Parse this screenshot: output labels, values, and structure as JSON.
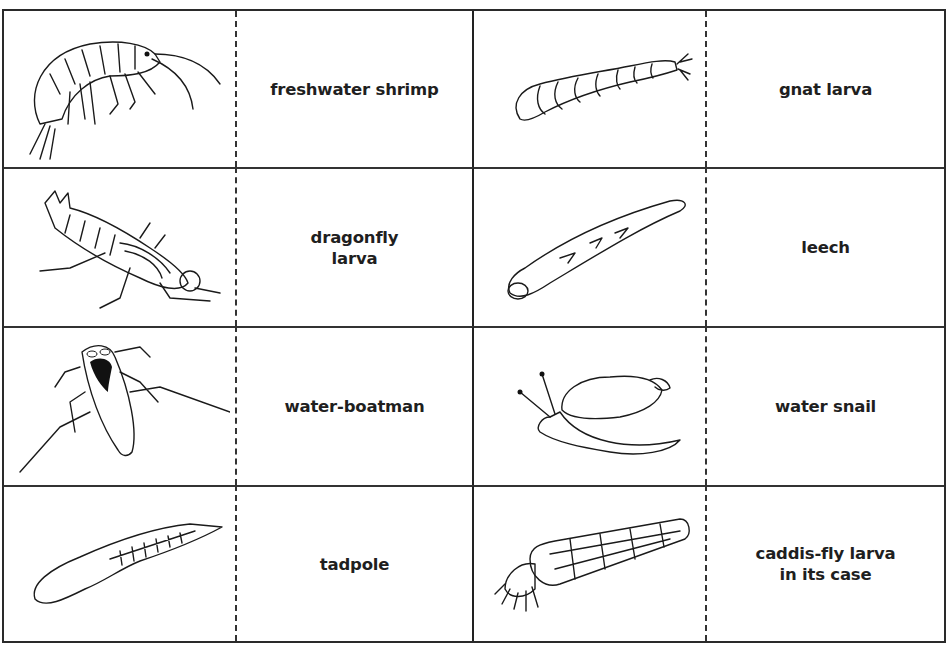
{
  "cards": [
    {
      "row": 0,
      "col": 0,
      "picture": "freshwater-shrimp-drawing",
      "label": "freshwater shrimp"
    },
    {
      "row": 0,
      "col": 1,
      "picture": "gnat-larva-drawing",
      "label": "gnat larva"
    },
    {
      "row": 1,
      "col": 0,
      "picture": "dragonfly-larva-drawing",
      "label": "dragonfly\nlarva"
    },
    {
      "row": 1,
      "col": 1,
      "picture": "leech-drawing",
      "label": "leech"
    },
    {
      "row": 2,
      "col": 0,
      "picture": "water-boatman-drawing",
      "label": "water-boatman"
    },
    {
      "row": 2,
      "col": 1,
      "picture": "water-snail-drawing",
      "label": "water snail"
    },
    {
      "row": 3,
      "col": 0,
      "picture": "tadpole-drawing",
      "label": "tadpole"
    },
    {
      "row": 3,
      "col": 1,
      "picture": "caddis-fly-larva-drawing",
      "label": "caddis-fly larva\nin its case"
    }
  ],
  "colors": {
    "ink": "#1a1a1a",
    "paper": "#ffffff"
  }
}
